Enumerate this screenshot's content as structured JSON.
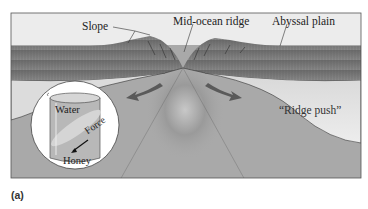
{
  "figure": {
    "panel_label": "(a)",
    "labels": {
      "slope": "Slope",
      "mid_ocean_ridge": "Mid-ocean ridge",
      "abyssal_plain": "Abyssal plain",
      "ridge_push": "“Ridge push”"
    },
    "inset": {
      "top_layer": "Water",
      "bottom_layer": "Honey",
      "arrow_label": "Force"
    },
    "colors": {
      "ocean": "#ececec",
      "lithosphere": "#7a7a7a",
      "lithosphere_dark": "#5e5e5e",
      "mantle": "#a9a9a9",
      "ridge_push_wedge": "#e2e2e2",
      "arrow": "#5a5a5a",
      "frame": "#555555",
      "inset_bg": "#ffffff",
      "beaker_fill": "#b8b8b8"
    }
  }
}
